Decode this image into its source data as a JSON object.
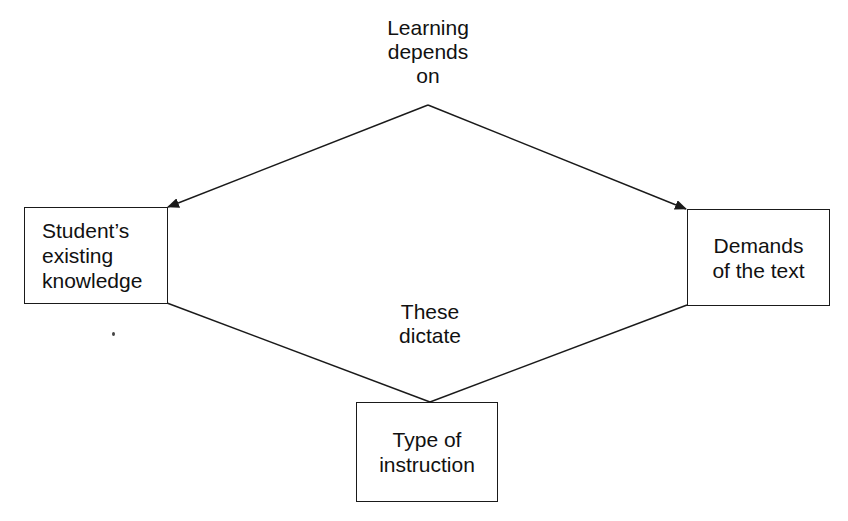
{
  "diagram": {
    "top_label": {
      "lines": [
        "Learning",
        "depends",
        "on"
      ]
    },
    "middle_label": {
      "lines": [
        "These",
        "dictate"
      ]
    },
    "nodes": [
      {
        "id": "student-knowledge",
        "lines": [
          "Student’s",
          "existing",
          "knowledge"
        ]
      },
      {
        "id": "demands-text",
        "lines": [
          "Demands",
          "of the text"
        ]
      },
      {
        "id": "type-instruction",
        "lines": [
          "Type of",
          "instruction"
        ]
      }
    ],
    "edges": [
      {
        "from": "Learning depends on",
        "to": "student-knowledge",
        "arrow": true
      },
      {
        "from": "Learning depends on",
        "to": "demands-text",
        "arrow": true
      },
      {
        "from": "student-knowledge",
        "to": "type-instruction",
        "arrow": false
      },
      {
        "from": "demands-text",
        "to": "type-instruction",
        "arrow": false
      }
    ],
    "colors": {
      "line": "#1a1a1a",
      "background": "#ffffff"
    }
  }
}
